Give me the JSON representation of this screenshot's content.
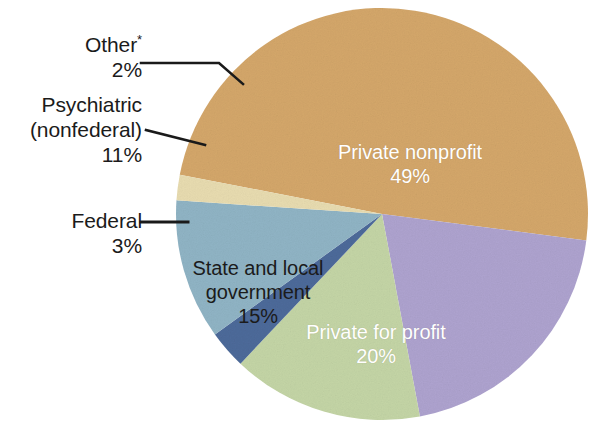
{
  "chart_data": {
    "type": "pie",
    "title": "",
    "subtitle": "",
    "xlabel": "",
    "ylabel": "",
    "legend_position": "none",
    "grid": false,
    "categories": [
      "Private nonprofit",
      "Private for profit",
      "State and local government",
      "Federal",
      "Psychiatric (nonfederal)",
      "Other*"
    ],
    "values": [
      49,
      20,
      15,
      3,
      11,
      2
    ],
    "value_unit": "%",
    "slices": [
      {
        "name": "Private nonprofit",
        "label_line1": "Private nonprofit",
        "label_line2": "49%",
        "value": 49,
        "percent_text": "49%",
        "color": "#d4a76a",
        "label_placement": "inside",
        "label_color": "#ffffff"
      },
      {
        "name": "Private for profit",
        "label_line1": "Private for profit",
        "label_line2": "20%",
        "value": 20,
        "percent_text": "20%",
        "color": "#aea3cf",
        "label_placement": "inside",
        "label_color": "#ffffff"
      },
      {
        "name": "State and local government",
        "label_line1": "State and local",
        "label_line2": "government",
        "label_line3": "15%",
        "value": 15,
        "percent_text": "15%",
        "color": "#c4d5a6",
        "label_placement": "inside",
        "label_color": "#1b1b1b"
      },
      {
        "name": "Federal",
        "label_line1": "Federal",
        "label_line2": "3%",
        "value": 3,
        "percent_text": "3%",
        "color": "#4d6a9a",
        "label_placement": "outside",
        "label_color": "#1b1b1b"
      },
      {
        "name": "Psychiatric (nonfederal)",
        "label_line1": "Psychiatric",
        "label_line2": "(nonfederal)",
        "label_line3": "11%",
        "value": 11,
        "percent_text": "11%",
        "color": "#90b4c5",
        "label_placement": "outside",
        "label_color": "#1b1b1b"
      },
      {
        "name": "Other",
        "label_line1": "Other",
        "label_footnote_marker": "*",
        "label_line2": "2%",
        "value": 2,
        "percent_text": "2%",
        "color": "#e8dcb0",
        "label_placement": "outside",
        "label_color": "#1b1b1b"
      }
    ]
  },
  "labels": {
    "other": {
      "name": "Other",
      "marker": "*",
      "percent": "2%"
    },
    "psychiatric": {
      "line1": "Psychiatric",
      "line2": "(nonfederal)",
      "percent": "11%"
    },
    "federal": {
      "name": "Federal",
      "percent": "3%"
    },
    "private_nonprofit": {
      "name": "Private nonprofit",
      "percent": "49%"
    },
    "private_for_profit": {
      "name": "Private for profit",
      "percent": "20%"
    },
    "state_local": {
      "line1": "State and local",
      "line2": "government",
      "percent": "15%"
    }
  },
  "colors": {
    "private_nonprofit": "#d4a76a",
    "private_for_profit": "#aea3cf",
    "state_local": "#c4d5a6",
    "federal": "#4d6a9a",
    "psychiatric": "#90b4c5",
    "other": "#e8dcb0",
    "background": "#ffffff",
    "leader_line": "#1a1a1a",
    "text_dark": "#1b1b1b",
    "text_light": "#ffffff"
  },
  "geometry": {
    "center_x": 382,
    "center_y": 214,
    "radius": 206
  }
}
